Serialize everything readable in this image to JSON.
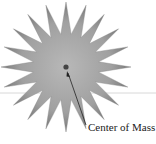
{
  "diagram": {
    "label": "Center of Mass",
    "star_points": 20,
    "colors": {
      "star_center": "#b5b5b5",
      "star_edge": "#7a7a7a",
      "dot": "#444444",
      "arrow": "#222222",
      "line": "#d8d8d8"
    }
  }
}
